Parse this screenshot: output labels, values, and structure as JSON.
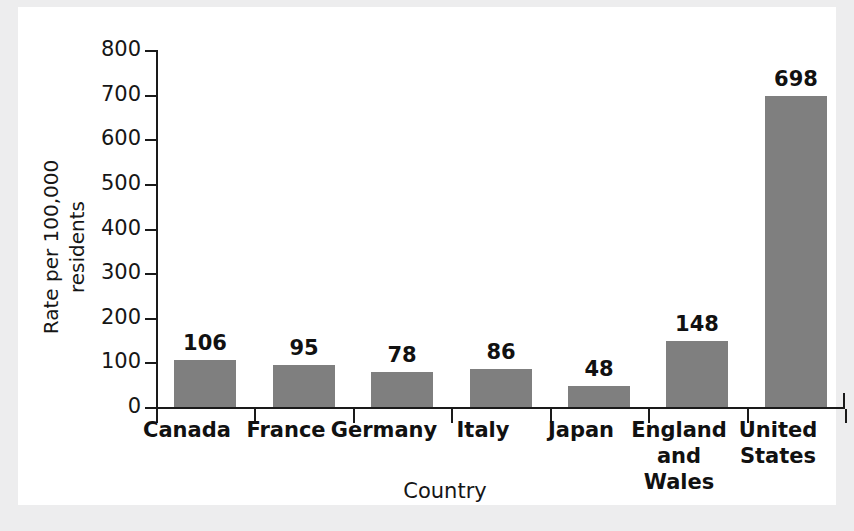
{
  "chart_data": {
    "type": "bar",
    "title": "",
    "xlabel": "Country",
    "ylabel": "Rate per 100,000\nresidents",
    "categories": [
      "Canada",
      "France",
      "Germany",
      "Italy",
      "Japan",
      "England\nand Wales",
      "United\nStates"
    ],
    "values": [
      106,
      95,
      78,
      86,
      48,
      148,
      698
    ],
    "value_labels": [
      "106",
      "95",
      "78",
      "86",
      "48",
      "148",
      "698"
    ],
    "ylim": [
      0,
      800
    ],
    "ytick_labels": [
      "800",
      "700",
      "600",
      "500",
      "400",
      "300",
      "200",
      "100",
      "0"
    ],
    "ytick_values": [
      800,
      700,
      600,
      500,
      400,
      300,
      200,
      100,
      0
    ],
    "grid": false,
    "legend": false,
    "bar_color": "#7f7f7f",
    "axis_color": "#1a1a1a",
    "background_color": "#ffffff"
  }
}
